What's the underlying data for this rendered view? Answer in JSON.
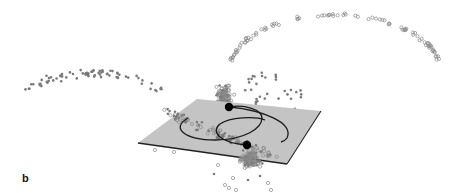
{
  "figure": {
    "panel_label": "b",
    "colors": {
      "plane_fill": "#c4c4c4",
      "plane_edge": "#222222",
      "filled_marker": "#7a7a7a",
      "open_marker": "#8a8a8a",
      "orbit_line": "#1a1a1a",
      "centroid": "#000000"
    },
    "legend": []
  },
  "groups": [
    {
      "name": "filled-points",
      "marker": "filled-circle"
    },
    {
      "name": "open-points",
      "marker": "open-circle"
    }
  ],
  "centroids": [
    {
      "name": "centroid-upper"
    },
    {
      "name": "centroid-lower"
    }
  ]
}
